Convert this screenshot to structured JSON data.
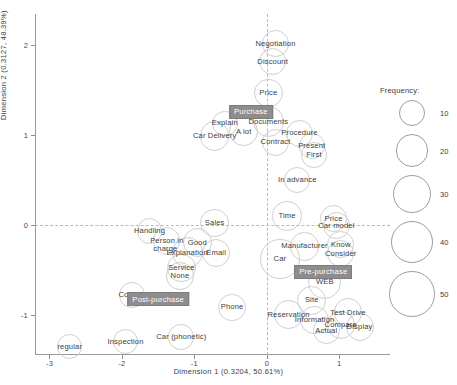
{
  "chart_data": {
    "type": "scatter",
    "title": "",
    "xlabel": "Dimension 1  (0.3204,  50.61%)",
    "ylabel": "Dimension 2  (0.3127,  48.39%)",
    "xlim": [
      -3.2,
      1.7
    ],
    "ylim": [
      -1.45,
      2.35
    ],
    "xticks": [
      "-3",
      "-2",
      "-1",
      "0",
      "1"
    ],
    "xtickvals": [
      -3,
      -2,
      -1,
      0,
      1
    ],
    "yticks": [
      "2",
      "1",
      "0",
      "-1"
    ],
    "ytickvals": [
      2,
      1,
      0,
      -1
    ],
    "grid": false,
    "reference_lines": {
      "x": 0,
      "y": 0,
      "style": "dashed"
    },
    "size_encoding": "Frequency",
    "legend": {
      "title": "Frequency:",
      "position": "right",
      "entries": [
        {
          "label": "10",
          "value": 10
        },
        {
          "label": "20",
          "value": 20
        },
        {
          "label": "30",
          "value": 30
        },
        {
          "label": "40",
          "value": 40
        },
        {
          "label": "50",
          "value": 50
        }
      ]
    },
    "points": [
      {
        "label": "Negotiation",
        "x": 0.12,
        "y": 2.02,
        "freq": 11,
        "anchor": "above"
      },
      {
        "label": "Discount",
        "x": 0.08,
        "y": 1.82,
        "freq": 11,
        "anchor": "above"
      },
      {
        "label": "Price",
        "x": 0.02,
        "y": 1.47,
        "freq": 13,
        "anchor": "above"
      },
      {
        "label": "Purchase",
        "x": -0.22,
        "y": 1.26,
        "freq": 0,
        "anchor": "center",
        "highlight": true
      },
      {
        "label": "Documents",
        "x": 0.02,
        "y": 1.15,
        "freq": 17,
        "anchor": "above"
      },
      {
        "label": "Explain",
        "x": -0.58,
        "y": 1.13,
        "freq": 9,
        "anchor": "left"
      },
      {
        "label": "A lot",
        "x": -0.32,
        "y": 1.04,
        "freq": 13,
        "anchor": "above"
      },
      {
        "label": "Procedure",
        "x": 0.45,
        "y": 1.02,
        "freq": 11,
        "anchor": "above"
      },
      {
        "label": "Contract",
        "x": 0.12,
        "y": 0.92,
        "freq": 11,
        "anchor": "above"
      },
      {
        "label": "Present",
        "x": 0.62,
        "y": 0.88,
        "freq": 9,
        "anchor": "above"
      },
      {
        "label": "First",
        "x": 0.65,
        "y": 0.78,
        "freq": 9,
        "anchor": "above"
      },
      {
        "label": "Car Delivery",
        "x": -0.72,
        "y": 0.99,
        "freq": 14,
        "anchor": "center"
      },
      {
        "label": "In advance",
        "x": 0.42,
        "y": 0.5,
        "freq": 9,
        "anchor": "center"
      },
      {
        "label": "Time",
        "x": 0.28,
        "y": 0.1,
        "freq": 14,
        "anchor": "center"
      },
      {
        "label": "Price",
        "x": 0.92,
        "y": 0.07,
        "freq": 11,
        "anchor": "above"
      },
      {
        "label": "Car model",
        "x": 0.96,
        "y": -0.01,
        "freq": 11,
        "anchor": "above"
      },
      {
        "label": "Sales",
        "x": -0.72,
        "y": 0.02,
        "freq": 13,
        "anchor": "above"
      },
      {
        "label": "Handling",
        "x": -1.62,
        "y": -0.07,
        "freq": 9,
        "anchor": "above"
      },
      {
        "label": "Person in",
        "x": -1.38,
        "y": -0.18,
        "freq": 11,
        "anchor": "above"
      },
      {
        "label": "charge",
        "x": -1.4,
        "y": -0.27,
        "freq": 0,
        "anchor": "above"
      },
      {
        "label": "Good",
        "x": -0.96,
        "y": -0.2,
        "freq": 14,
        "anchor": "above"
      },
      {
        "label": "Explanation",
        "x": -1.1,
        "y": -0.31,
        "freq": 17,
        "anchor": "above"
      },
      {
        "label": "Email",
        "x": -0.7,
        "y": -0.31,
        "freq": 12,
        "anchor": "above"
      },
      {
        "label": "Manufacturer",
        "x": 0.52,
        "y": -0.24,
        "freq": 13,
        "anchor": "above"
      },
      {
        "label": "Know",
        "x": 1.02,
        "y": -0.22,
        "freq": 11,
        "anchor": "above"
      },
      {
        "label": "Consider",
        "x": 1.02,
        "y": -0.32,
        "freq": 11,
        "anchor": "above"
      },
      {
        "label": "Car",
        "x": 0.18,
        "y": -0.38,
        "freq": 34,
        "anchor": "center"
      },
      {
        "label": "Service",
        "x": -1.18,
        "y": -0.48,
        "freq": 13,
        "anchor": "above"
      },
      {
        "label": "None",
        "x": -1.2,
        "y": -0.57,
        "freq": 13,
        "anchor": "above"
      },
      {
        "label": "Pre-purchase",
        "x": 0.78,
        "y": -0.52,
        "freq": 0,
        "anchor": "center",
        "highlight": true
      },
      {
        "label": "WEB",
        "x": 0.8,
        "y": -0.64,
        "freq": 20,
        "anchor": "center"
      },
      {
        "label": "Contact",
        "x": -1.86,
        "y": -0.78,
        "freq": 9,
        "anchor": "left"
      },
      {
        "label": "Post-purchase",
        "x": -1.5,
        "y": -0.83,
        "freq": 0,
        "anchor": "center",
        "highlight": true
      },
      {
        "label": "Site",
        "x": 0.62,
        "y": -0.84,
        "freq": 14,
        "anchor": "center"
      },
      {
        "label": "Phone",
        "x": -0.48,
        "y": -0.92,
        "freq": 11,
        "anchor": "center"
      },
      {
        "label": "Reservation",
        "x": 0.3,
        "y": -1.0,
        "freq": 13,
        "anchor": "center"
      },
      {
        "label": "Information",
        "x": 0.66,
        "y": -1.06,
        "freq": 13,
        "anchor": "center"
      },
      {
        "label": "Test Drive",
        "x": 1.12,
        "y": -0.98,
        "freq": 13,
        "anchor": "center"
      },
      {
        "label": "Compare",
        "x": 1.02,
        "y": -1.12,
        "freq": 12,
        "anchor": "center"
      },
      {
        "label": "Display",
        "x": 1.28,
        "y": -1.14,
        "freq": 12,
        "anchor": "center"
      },
      {
        "label": "Actual",
        "x": 0.82,
        "y": -1.18,
        "freq": 11,
        "anchor": "center"
      },
      {
        "label": "Car (phonetic)",
        "x": -1.18,
        "y": -1.25,
        "freq": 9,
        "anchor": "center"
      },
      {
        "label": "Inspection",
        "x": -1.95,
        "y": -1.3,
        "freq": 9,
        "anchor": "center"
      },
      {
        "label": "regular",
        "x": -2.72,
        "y": -1.36,
        "freq": 8,
        "anchor": "center"
      }
    ]
  }
}
